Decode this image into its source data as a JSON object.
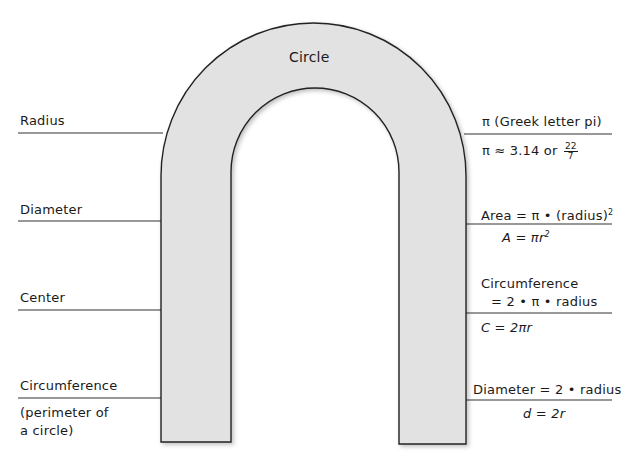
{
  "diagram": {
    "title": "Circle",
    "colors": {
      "fill": "#e2e2e2",
      "stroke": "#222222",
      "line": "#333333"
    },
    "left_labels": [
      {
        "id": "radius",
        "text": "Radius"
      },
      {
        "id": "diameter",
        "text": "Diameter"
      },
      {
        "id": "center",
        "text": "Center"
      },
      {
        "id": "circumference",
        "text": "Circumference",
        "note_line1": "(perimeter of",
        "note_line2": "a circle)"
      }
    ],
    "right_labels": [
      {
        "id": "pi",
        "above": "π  (Greek letter pi)",
        "below_prefix": "π ≈ 3.14 or",
        "fraction_num": "22",
        "fraction_den": "7"
      },
      {
        "id": "area",
        "above_prefix": "Area = π • (radius)",
        "above_sup": "2",
        "below_prefix": "A = πr",
        "below_sup": "2"
      },
      {
        "id": "circumference",
        "above_line1": "Circumference",
        "above_line2": "= 2 • π • radius",
        "below": "C = 2πr"
      },
      {
        "id": "diameter",
        "above": "Diameter = 2 • radius",
        "below": "d = 2r"
      }
    ]
  }
}
